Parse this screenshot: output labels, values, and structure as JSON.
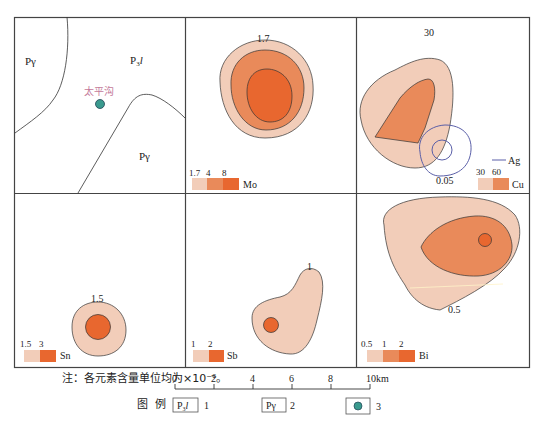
{
  "panels": {
    "geology": {
      "labels": {
        "pgamma_nw": "Pγ",
        "p3l": "P",
        "p3l_sub": "3",
        "p3l_suffix": "l",
        "pgamma_se": "Pγ",
        "place": "太平沟"
      }
    },
    "mo": {
      "element": "Mo",
      "contour_label": "1.7",
      "legend_values": [
        "1.7",
        "4",
        "8"
      ]
    },
    "cu": {
      "element": "Cu",
      "contour_label": "30",
      "legend_values": [
        "30",
        "60"
      ],
      "ag_label": "Ag",
      "ag_contour_label": "0.05"
    },
    "sn": {
      "element": "Sn",
      "contour_label": "1.5",
      "legend_values": [
        "1.5",
        "3"
      ]
    },
    "sb": {
      "element": "Sb",
      "contour_label": "1",
      "legend_values": [
        "1",
        "2"
      ]
    },
    "bi": {
      "element": "Bi",
      "contour_label": "0.5",
      "legend_values": [
        "0.5",
        "1",
        "2"
      ]
    }
  },
  "note": "注：各元素含量单位均为×10⁻⁶。",
  "scale_bar": {
    "ticks": [
      "0",
      "2",
      "4",
      "6",
      "8",
      "10km"
    ]
  },
  "legend": {
    "title": "图  例",
    "items": [
      {
        "symbol": "P",
        "sub": "3",
        "suffix": "l",
        "number": "1"
      },
      {
        "symbol": "Pγ",
        "number": "2"
      },
      {
        "symbol": "dot",
        "number": "3"
      }
    ]
  },
  "colors": {
    "low": "#f2cdb9",
    "mid": "#e98a5a",
    "high": "#e8672f",
    "ag_line": "#5a5fa8",
    "dot": "#3a9a8e",
    "frame": "#444444"
  }
}
